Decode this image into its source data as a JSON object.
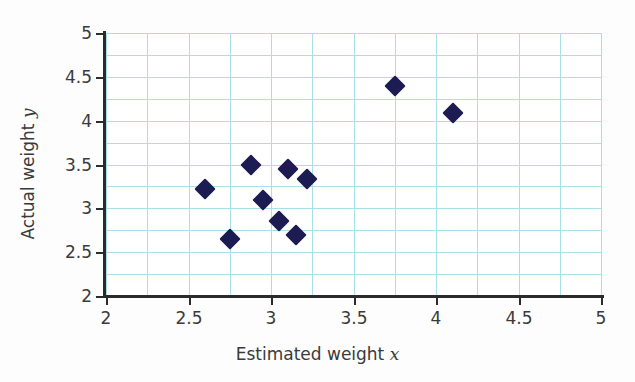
{
  "chart_data": {
    "type": "scatter",
    "title": "",
    "xlabel": "Estimated weight x",
    "ylabel": "Actual weight y",
    "xlabel_text": "Estimated weight ",
    "xlabel_var": "x",
    "ylabel_text": "Actual weight ",
    "ylabel_var": "y",
    "xlim": [
      2,
      5
    ],
    "ylim": [
      2,
      5
    ],
    "xticks": [
      2,
      2.5,
      3,
      3.5,
      4,
      4.5,
      5
    ],
    "yticks": [
      2,
      2.5,
      3,
      3.5,
      4,
      4.5,
      5
    ],
    "xtick_labels": [
      "2",
      "2.5",
      "3",
      "3.5",
      "4",
      "4.5",
      "5"
    ],
    "ytick_labels": [
      "2",
      "2.5",
      "3",
      "3.5",
      "4",
      "4.5",
      "5"
    ],
    "minor_grid_step": 0.25,
    "grid": true,
    "grid_color": "#a8dfe8",
    "marker_color": "#1c1c52",
    "marker_shape": "diamond",
    "legend": null,
    "points": [
      {
        "x": 2.6,
        "y": 3.22
      },
      {
        "x": 2.75,
        "y": 2.65
      },
      {
        "x": 2.88,
        "y": 3.5
      },
      {
        "x": 2.95,
        "y": 3.1
      },
      {
        "x": 3.05,
        "y": 2.85
      },
      {
        "x": 3.1,
        "y": 3.45
      },
      {
        "x": 3.15,
        "y": 2.7
      },
      {
        "x": 3.22,
        "y": 3.34
      },
      {
        "x": 3.75,
        "y": 4.39
      },
      {
        "x": 4.1,
        "y": 4.09
      }
    ]
  }
}
